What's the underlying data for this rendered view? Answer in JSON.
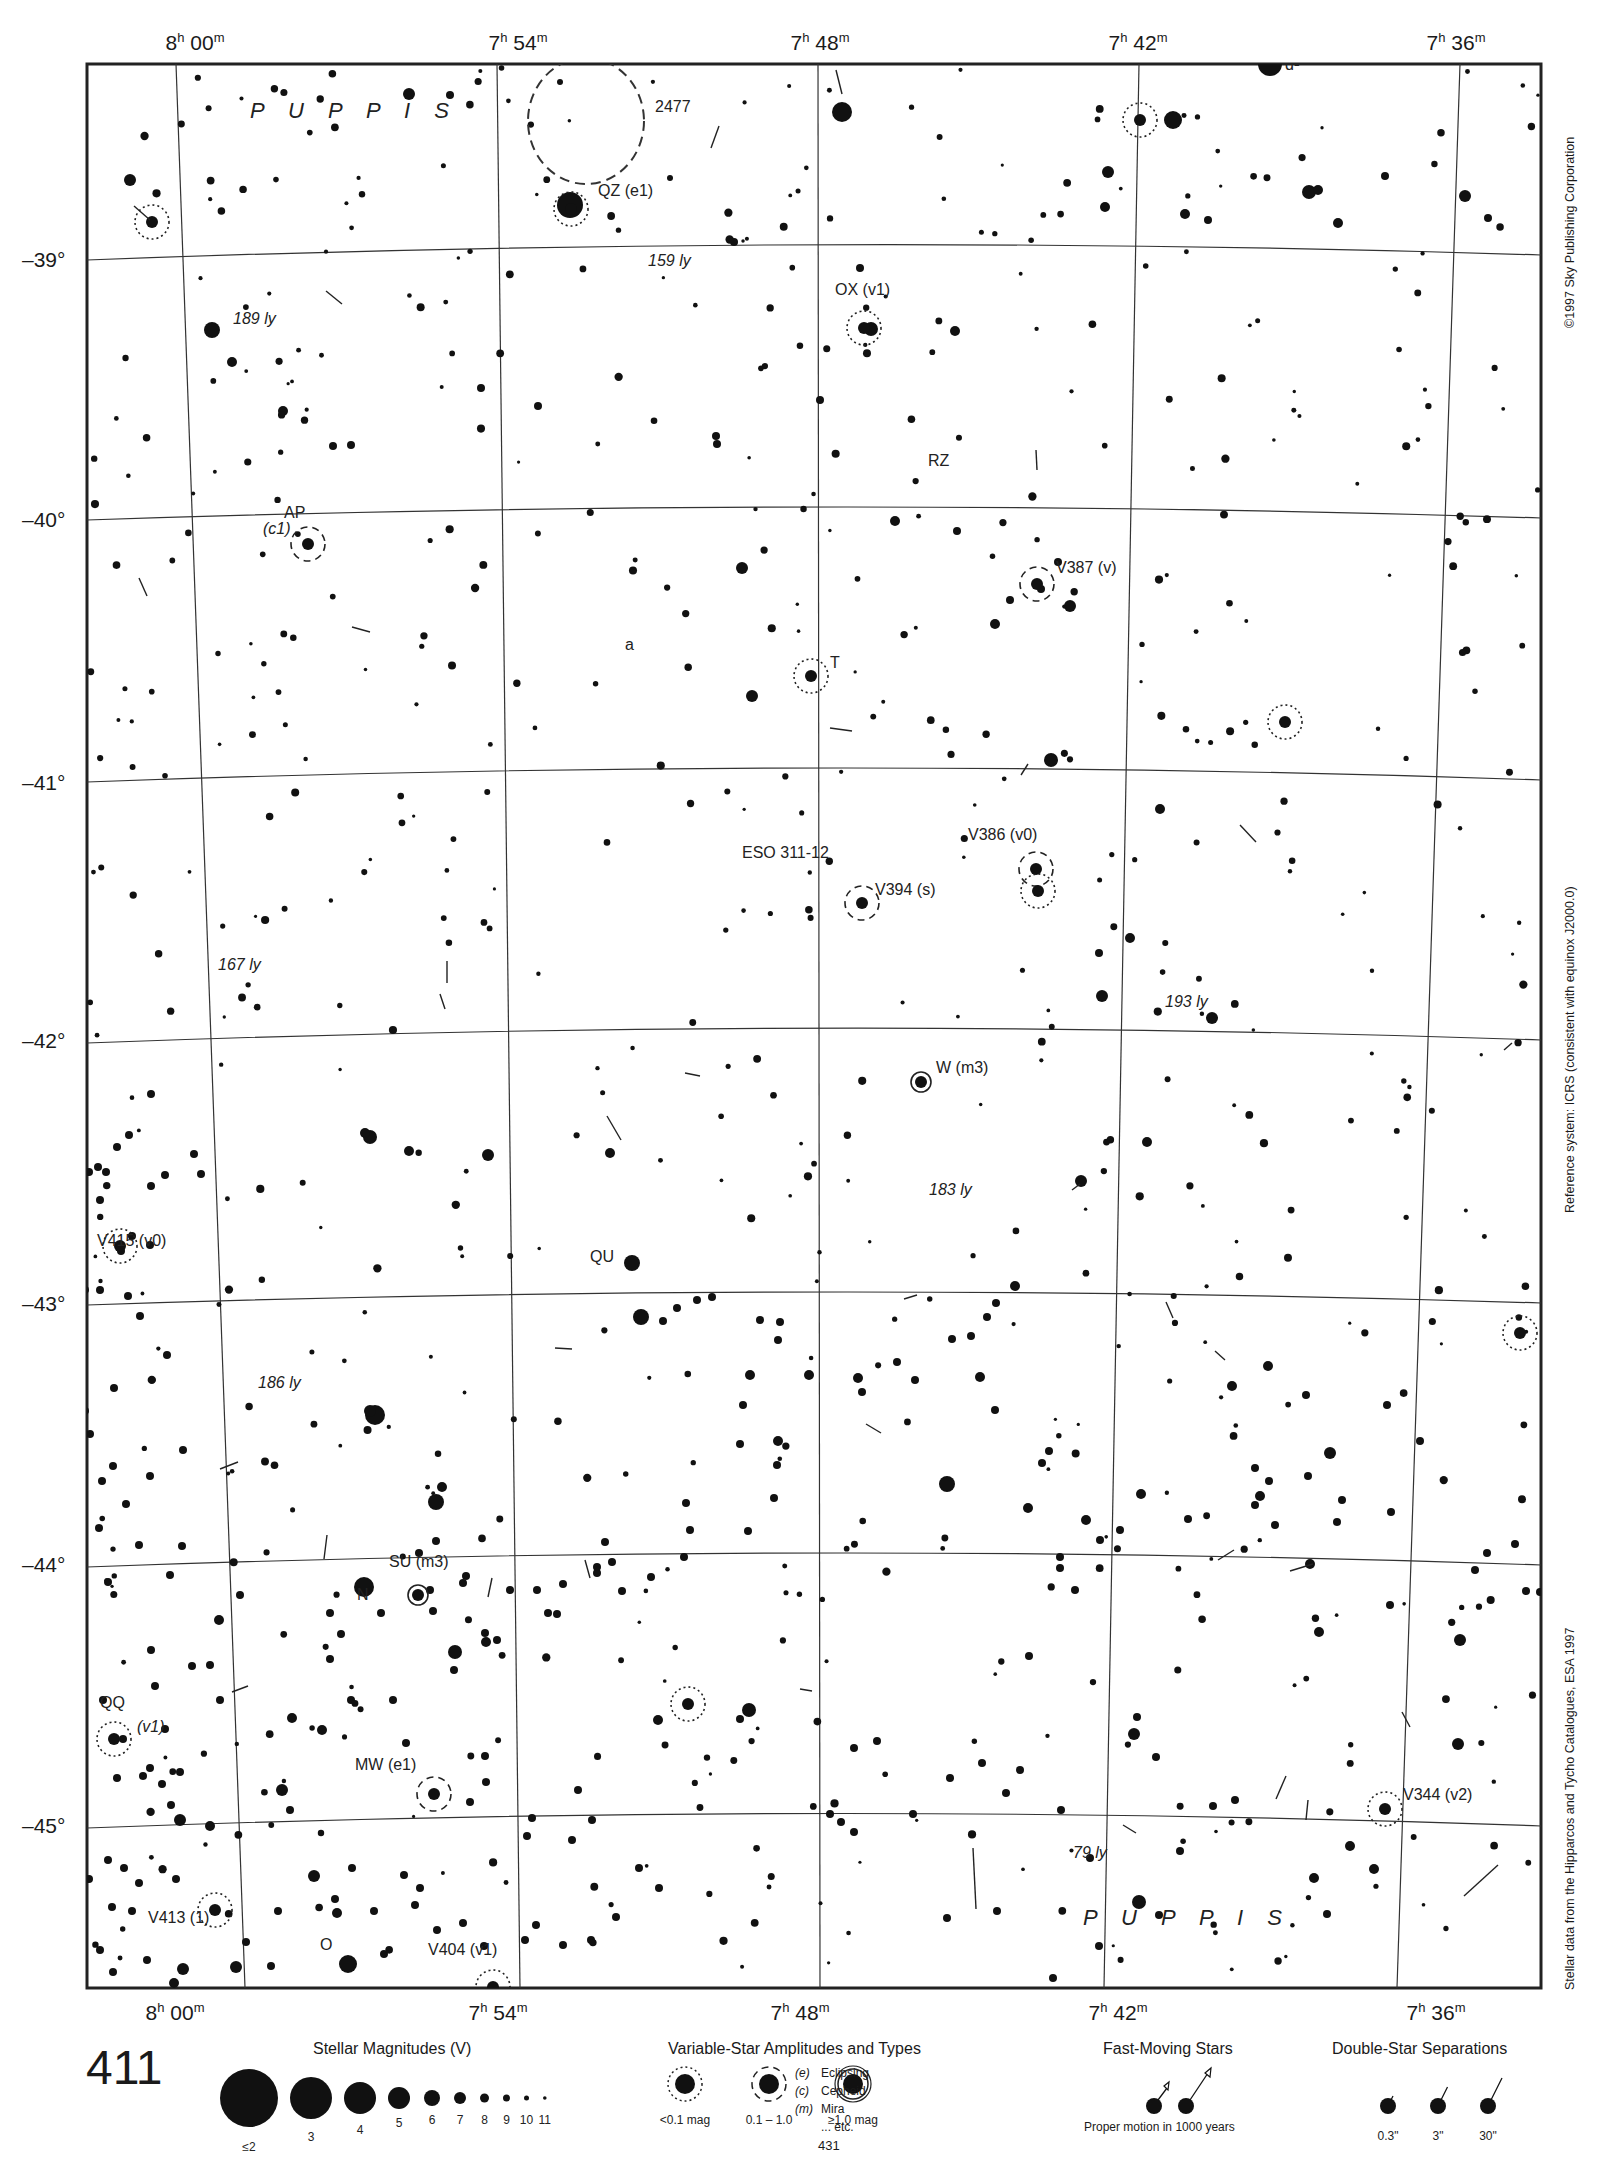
{
  "chart_title_page": "411",
  "adjacent_page_bottom": "431",
  "ra_labels": [
    {
      "h": "8",
      "m": "00",
      "x": 195
    },
    {
      "h": "7",
      "m": "54",
      "x": 518
    },
    {
      "h": "7",
      "m": "48",
      "x": 820
    },
    {
      "h": "7",
      "m": "42",
      "x": 1138
    },
    {
      "h": "7",
      "m": "36",
      "x": 1456
    }
  ],
  "dec_labels": [
    {
      "label": "–39°",
      "y": 262
    },
    {
      "label": "–40°",
      "y": 522
    },
    {
      "label": "–41°",
      "y": 785
    },
    {
      "label": "–42°",
      "y": 1043
    },
    {
      "label": "–43°",
      "y": 1306
    },
    {
      "label": "–44°",
      "y": 1567
    },
    {
      "label": "–45°",
      "y": 1828
    }
  ],
  "constellation_labels": [
    {
      "text": "P U P P I S",
      "x": 250,
      "y": 118
    },
    {
      "text": "P U P P I S",
      "x": 1083,
      "y": 1925
    }
  ],
  "objects": [
    {
      "text": "2477",
      "x": 655,
      "y": 112
    },
    {
      "text": "QZ (e1)",
      "x": 598,
      "y": 196
    },
    {
      "text": "159 ly",
      "x": 648,
      "y": 266,
      "italic": true
    },
    {
      "text": "OX (v1)",
      "x": 835,
      "y": 295
    },
    {
      "text": "189 ly",
      "x": 233,
      "y": 324,
      "italic": true
    },
    {
      "text": "d¹",
      "x": 1285,
      "y": 70
    },
    {
      "text": "RZ",
      "x": 928,
      "y": 466
    },
    {
      "text": "AP",
      "x": 284,
      "y": 518
    },
    {
      "text": "(c1)",
      "x": 263,
      "y": 534,
      "italic": true
    },
    {
      "text": "V387 (v)",
      "x": 1056,
      "y": 573
    },
    {
      "text": "a",
      "x": 625,
      "y": 650
    },
    {
      "text": "T",
      "x": 830,
      "y": 668
    },
    {
      "text": "ESO 311-12",
      "x": 742,
      "y": 858
    },
    {
      "text": "V386 (v0)",
      "x": 968,
      "y": 840
    },
    {
      "text": "V394 (s)",
      "x": 875,
      "y": 895
    },
    {
      "text": "167 ly",
      "x": 218,
      "y": 970,
      "italic": true
    },
    {
      "text": "193 ly",
      "x": 1165,
      "y": 1007,
      "italic": true
    },
    {
      "text": "W (m3)",
      "x": 936,
      "y": 1073
    },
    {
      "text": "183 ly",
      "x": 929,
      "y": 1195,
      "italic": true
    },
    {
      "text": "V415 (v0)",
      "x": 97,
      "y": 1246
    },
    {
      "text": "QU",
      "x": 590,
      "y": 1262
    },
    {
      "text": "186 ly",
      "x": 258,
      "y": 1388,
      "italic": true
    },
    {
      "text": "SU (m3)",
      "x": 389,
      "y": 1567
    },
    {
      "text": "N",
      "x": 357,
      "y": 1600
    },
    {
      "text": "QQ",
      "x": 100,
      "y": 1708
    },
    {
      "text": "(v1)",
      "x": 137,
      "y": 1732,
      "italic": true
    },
    {
      "text": "MW (e1)",
      "x": 355,
      "y": 1770
    },
    {
      "text": "V344 (v2)",
      "x": 1403,
      "y": 1800
    },
    {
      "text": "79 ly",
      "x": 1073,
      "y": 1858,
      "italic": true
    },
    {
      "text": "V413 (1)",
      "x": 148,
      "y": 1923
    },
    {
      "text": "O",
      "x": 320,
      "y": 1950
    },
    {
      "text": "V404 (v1)",
      "x": 428,
      "y": 1955
    }
  ],
  "side_notes": {
    "copyright": "©1997 Sky Publishing Corporation",
    "reference": "Reference system: ICRS (consistent with equinox J2000.0)",
    "source": "Stellar data from the Hipparcos and Tycho Catalogues, ESA 1997"
  },
  "legend": {
    "magnitudes": {
      "title": "Stellar Magnitudes (V)",
      "items": [
        {
          "label": "≤2",
          "r": 29
        },
        {
          "label": "3",
          "r": 21
        },
        {
          "label": "4",
          "r": 16
        },
        {
          "label": "5",
          "r": 11
        },
        {
          "label": "6",
          "r": 8
        },
        {
          "label": "7",
          "r": 6
        },
        {
          "label": "8",
          "r": 4.5
        },
        {
          "label": "9",
          "r": 3.5
        },
        {
          "label": "10",
          "r": 2.5
        },
        {
          "label": "11",
          "r": 1.8
        }
      ]
    },
    "variables": {
      "title": "Variable-Star Amplitudes and Types",
      "items": [
        {
          "label": "<0.1 mag",
          "style": "dotted"
        },
        {
          "label": "0.1 – 1.0",
          "style": "dashed"
        },
        {
          "label": "≥1.0 mag",
          "style": "solid"
        }
      ],
      "types": [
        {
          "code": "(e)",
          "name": "Eclipsing"
        },
        {
          "code": "(c)",
          "name": "Cepheid"
        },
        {
          "code": "(m)",
          "name": "Mira"
        },
        {
          "code": "",
          "name": "... etc."
        }
      ]
    },
    "fast_moving": {
      "title": "Fast-Moving Stars",
      "caption": "Proper motion in 1000 years"
    },
    "doubles": {
      "title": "Double-Star Separations",
      "items": [
        "0.3\"",
        "3\"",
        "30\""
      ]
    }
  },
  "stars": [
    [
      1270,
      64,
      12
    ],
    [
      842,
      112,
      10
    ],
    [
      1173,
      120,
      9
    ],
    [
      409,
      94,
      6
    ],
    [
      450,
      95,
      4
    ],
    [
      560,
      82,
      3
    ],
    [
      130,
      180,
      6
    ],
    [
      570,
      205,
      13
    ],
    [
      670,
      178,
      3
    ],
    [
      734,
      242,
      4
    ],
    [
      860,
      268,
      4
    ],
    [
      871,
      329,
      7
    ],
    [
      955,
      331,
      5
    ],
    [
      1108,
      172,
      6
    ],
    [
      1105,
      207,
      5
    ],
    [
      1185,
      214,
      5
    ],
    [
      1208,
      220,
      4
    ],
    [
      1309,
      192,
      7
    ],
    [
      1318,
      190,
      5
    ],
    [
      1338,
      223,
      5
    ],
    [
      1385,
      176,
      4
    ],
    [
      1465,
      196,
      6
    ],
    [
      1488,
      218,
      4
    ],
    [
      212,
      330,
      8
    ],
    [
      232,
      362,
      5
    ],
    [
      283,
      411,
      5
    ],
    [
      333,
      446,
      4
    ],
    [
      351,
      445,
      4
    ],
    [
      481,
      388,
      4
    ],
    [
      538,
      406,
      4
    ],
    [
      717,
      444,
      4
    ],
    [
      716,
      436,
      4
    ],
    [
      742,
      568,
      6
    ],
    [
      752,
      696,
      6
    ],
    [
      820,
      400,
      4
    ],
    [
      895,
      521,
      5
    ],
    [
      957,
      531,
      4
    ],
    [
      995,
      624,
      5
    ],
    [
      1010,
      600,
      4
    ],
    [
      1041,
      589,
      4
    ],
    [
      1058,
      562,
      4
    ],
    [
      1070,
      606,
      6
    ],
    [
      1051,
      760,
      7
    ],
    [
      1160,
      809,
      5
    ],
    [
      1130,
      938,
      5
    ],
    [
      1099,
      953,
      4
    ],
    [
      1102,
      996,
      6
    ],
    [
      1212,
      1018,
      6
    ],
    [
      1147,
      1142,
      5
    ],
    [
      1081,
      1181,
      6
    ],
    [
      1015,
      1286,
      5
    ],
    [
      996,
      1303,
      4
    ],
    [
      987,
      1317,
      4
    ],
    [
      1268,
      1366,
      5
    ],
    [
      1232,
      1386,
      5
    ],
    [
      1120,
      1530,
      4
    ],
    [
      1310,
      1564,
      5
    ],
    [
      1330,
      1453,
      6
    ],
    [
      1306,
      1395,
      4
    ],
    [
      947,
      1484,
      8
    ],
    [
      858,
      1378,
      5
    ],
    [
      862,
      1392,
      4
    ],
    [
      750,
      1375,
      5
    ],
    [
      778,
      1441,
      5
    ],
    [
      641,
      1317,
      8
    ],
    [
      632,
      1263,
      8
    ],
    [
      370,
      1137,
      7
    ],
    [
      365,
      1133,
      5
    ],
    [
      488,
      1155,
      6
    ],
    [
      409,
      1151,
      5
    ],
    [
      610,
      1153,
      5
    ],
    [
      375,
      1415,
      10
    ],
    [
      370,
      1411,
      6
    ],
    [
      436,
      1502,
      8
    ],
    [
      442,
      1487,
      5
    ],
    [
      364,
      1587,
      10
    ],
    [
      433,
      1611,
      4
    ],
    [
      322,
      1730,
      5
    ],
    [
      290,
      1810,
      4
    ],
    [
      180,
      1820,
      6
    ],
    [
      210,
      1826,
      5
    ],
    [
      183,
      1969,
      6
    ],
    [
      236,
      1967,
      6
    ],
    [
      174,
      1983,
      5
    ],
    [
      348,
      1964,
      9
    ],
    [
      219,
      1620,
      5
    ],
    [
      240,
      1595,
      4
    ],
    [
      292,
      1718,
      5
    ],
    [
      282,
      1790,
      6
    ],
    [
      314,
      1876,
      6
    ],
    [
      337,
      1913,
      5
    ],
    [
      455,
      1652,
      7
    ],
    [
      486,
      1642,
      5
    ],
    [
      658,
      1720,
      5
    ],
    [
      749,
      1710,
      7
    ],
    [
      740,
      1719,
      4
    ],
    [
      1134,
      1734,
      6
    ],
    [
      1137,
      1717,
      4
    ],
    [
      1319,
      1632,
      5
    ],
    [
      1390,
      1605,
      4
    ],
    [
      1460,
      1640,
      6
    ],
    [
      1458,
      1744,
      6
    ],
    [
      1374,
      1869,
      5
    ],
    [
      1327,
      1914,
      4
    ],
    [
      1314,
      1878,
      5
    ],
    [
      1350,
      1846,
      5
    ],
    [
      1156,
      1757,
      4
    ],
    [
      1061,
      1810,
      4
    ],
    [
      1090,
      1858,
      4
    ],
    [
      1139,
      1902,
      7
    ],
    [
      1180,
      1851,
      4
    ],
    [
      1235,
      1800,
      4
    ],
    [
      1213,
      1806,
      4
    ],
    [
      1159,
      1915,
      4
    ],
    [
      1099,
      1946,
      4
    ],
    [
      1053,
      1978,
      4
    ],
    [
      997,
      1911,
      4
    ],
    [
      947,
      1918,
      4
    ],
    [
      1006,
      1793,
      4
    ],
    [
      1020,
      1770,
      4
    ],
    [
      982,
      1763,
      4
    ],
    [
      877,
      1741,
      4
    ],
    [
      854,
      1748,
      4
    ],
    [
      854,
      1832,
      4
    ],
    [
      841,
      1822,
      4
    ],
    [
      830,
      1814,
      4
    ],
    [
      913,
      1814,
      4
    ],
    [
      950,
      1778,
      4
    ],
    [
      1029,
      1656,
      4
    ],
    [
      1188,
      1519,
      4
    ],
    [
      1260,
      1496,
      5
    ],
    [
      1255,
      1468,
      4
    ],
    [
      1269,
      1481,
      4
    ],
    [
      1308,
      1476,
      4
    ],
    [
      1387,
      1405,
      4
    ],
    [
      1420,
      1441,
      4
    ],
    [
      1487,
      1553,
      4
    ],
    [
      1515,
      1544,
      4
    ],
    [
      1526,
      1591,
      4
    ],
    [
      1540,
      1592,
      4
    ],
    [
      1475,
      1570,
      4
    ],
    [
      1391,
      1512,
      4
    ],
    [
      1342,
      1500,
      4
    ],
    [
      1337,
      1522,
      4
    ],
    [
      1275,
      1525,
      4
    ],
    [
      1255,
      1505,
      4
    ],
    [
      1141,
      1494,
      5
    ],
    [
      1086,
      1520,
      5
    ],
    [
      1100,
      1540,
      4
    ],
    [
      1075,
      1590,
      4
    ],
    [
      1060,
      1568,
      4
    ],
    [
      1060,
      1557,
      4
    ],
    [
      1028,
      1508,
      5
    ],
    [
      1049,
      1451,
      4
    ],
    [
      1042,
      1463,
      4
    ],
    [
      995,
      1410,
      4
    ],
    [
      980,
      1377,
      5
    ],
    [
      915,
      1380,
      4
    ],
    [
      952,
      1339,
      4
    ],
    [
      971,
      1336,
      4
    ],
    [
      897,
      1362,
      4
    ],
    [
      809,
      1375,
      5
    ],
    [
      778,
      1340,
      4
    ],
    [
      760,
      1320,
      4
    ],
    [
      780,
      1322,
      4
    ],
    [
      712,
      1297,
      4
    ],
    [
      697,
      1300,
      4
    ],
    [
      677,
      1308,
      4
    ],
    [
      663,
      1321,
      4
    ],
    [
      743,
      1405,
      4
    ],
    [
      740,
      1444,
      4
    ],
    [
      777,
      1465,
      4
    ],
    [
      774,
      1498,
      4
    ],
    [
      748,
      1531,
      4
    ],
    [
      686,
      1503,
      4
    ],
    [
      690,
      1530,
      4
    ],
    [
      684,
      1557,
      4
    ],
    [
      605,
      1542,
      4
    ],
    [
      597,
      1573,
      4
    ],
    [
      597,
      1567,
      4
    ],
    [
      622,
      1591,
      4
    ],
    [
      612,
      1562,
      4
    ],
    [
      651,
      1577,
      4
    ],
    [
      563,
      1584,
      4
    ],
    [
      537,
      1590,
      4
    ],
    [
      510,
      1590,
      4
    ],
    [
      463,
      1583,
      4
    ],
    [
      557,
      1614,
      4
    ],
    [
      548,
      1613,
      4
    ],
    [
      497,
      1640,
      4
    ],
    [
      485,
      1633,
      4
    ],
    [
      430,
      1590,
      4
    ],
    [
      466,
      1576,
      4
    ],
    [
      436,
      1541,
      4
    ],
    [
      419,
      1553,
      4
    ],
    [
      330,
      1613,
      4
    ],
    [
      341,
      1634,
      4
    ],
    [
      381,
      1613,
      4
    ],
    [
      454,
      1670,
      4
    ],
    [
      330,
      1659,
      4
    ],
    [
      351,
      1700,
      4
    ],
    [
      393,
      1700,
      4
    ],
    [
      406,
      1743,
      4
    ],
    [
      485,
      1756,
      4
    ],
    [
      486,
      1782,
      4
    ],
    [
      470,
      1802,
      4
    ],
    [
      532,
      1818,
      4
    ],
    [
      527,
      1836,
      4
    ],
    [
      578,
      1790,
      4
    ],
    [
      592,
      1820,
      4
    ],
    [
      572,
      1840,
      4
    ],
    [
      639,
      1868,
      4
    ],
    [
      659,
      1888,
      4
    ],
    [
      616,
      1917,
      4
    ],
    [
      591,
      1940,
      4
    ],
    [
      563,
      1945,
      4
    ],
    [
      536,
      1925,
      4
    ],
    [
      525,
      1940,
      4
    ],
    [
      484,
      1946,
      4
    ],
    [
      463,
      1923,
      4
    ],
    [
      437,
      1930,
      4
    ],
    [
      404,
      1875,
      4
    ],
    [
      415,
      1905,
      4
    ],
    [
      420,
      1888,
      4
    ],
    [
      384,
      1954,
      4
    ],
    [
      352,
      1868,
      4
    ],
    [
      335,
      1899,
      4
    ],
    [
      374,
      1911,
      4
    ],
    [
      278,
      1911,
      4
    ],
    [
      271,
      1966,
      4
    ],
    [
      246,
      1942,
      4
    ],
    [
      124,
      1868,
      4
    ],
    [
      108,
      1860,
      4
    ],
    [
      112,
      1907,
      4
    ],
    [
      100,
      1950,
      4
    ],
    [
      113,
      1972,
      4
    ],
    [
      72,
      1964,
      4
    ],
    [
      89,
      1879,
      4
    ],
    [
      139,
      1883,
      4
    ],
    [
      132,
      1911,
      4
    ],
    [
      176,
      1879,
      4
    ],
    [
      147,
      1960,
      4
    ],
    [
      103,
      1700,
      4
    ],
    [
      123,
      1739,
      4
    ],
    [
      117,
      1778,
      4
    ],
    [
      162,
      1784,
      4
    ],
    [
      171,
      1805,
      4
    ],
    [
      150,
      1768,
      4
    ],
    [
      143,
      1776,
      4
    ],
    [
      220,
      1700,
      4
    ],
    [
      210,
      1665,
      4
    ],
    [
      192,
      1666,
      4
    ],
    [
      180,
      1772,
      4
    ],
    [
      155,
      1686,
      4
    ],
    [
      165,
      1729,
      4
    ],
    [
      151,
      1650,
      4
    ],
    [
      170,
      1575,
      4
    ],
    [
      108,
      1582,
      4
    ],
    [
      99,
      1528,
      4
    ],
    [
      139,
      1545,
      4
    ],
    [
      126,
      1504,
      4
    ],
    [
      182,
      1546,
      4
    ],
    [
      150,
      1476,
      4
    ],
    [
      183,
      1450,
      4
    ],
    [
      113,
      1466,
      4
    ],
    [
      102,
      1481,
      4
    ],
    [
      83,
      1458,
      4
    ],
    [
      114,
      1388,
      4
    ],
    [
      90,
      1434,
      4
    ],
    [
      85,
      1411,
      4
    ],
    [
      167,
      1355,
      4
    ],
    [
      140,
      1316,
      4
    ],
    [
      128,
      1296,
      4
    ],
    [
      85,
      1290,
      4
    ],
    [
      100,
      1290,
      4
    ],
    [
      121,
      1251,
      4
    ],
    [
      132,
      1236,
      4
    ],
    [
      150,
      1245,
      4
    ],
    [
      100,
      1200,
      4
    ],
    [
      106,
      1172,
      4
    ],
    [
      98,
      1167,
      4
    ],
    [
      165,
      1175,
      4
    ],
    [
      194,
      1154,
      4
    ],
    [
      201,
      1174,
      4
    ],
    [
      151,
      1186,
      4
    ],
    [
      117,
      1147,
      4
    ],
    [
      129,
      1135,
      4
    ],
    [
      151,
      1094,
      4
    ],
    [
      89,
      1172,
      4
    ]
  ],
  "variable_stars": [
    [
      571,
      209,
      "dotted"
    ],
    [
      152,
      222,
      "dotted"
    ],
    [
      864,
      328,
      "dotted"
    ],
    [
      1140,
      120,
      "dotted"
    ],
    [
      308,
      544,
      "dashed"
    ],
    [
      1037,
      584,
      "dashed"
    ],
    [
      811,
      676,
      "dotted"
    ],
    [
      1285,
      722,
      "dotted"
    ],
    [
      1036,
      869,
      "dashed"
    ],
    [
      1038,
      891,
      "dotted"
    ],
    [
      862,
      903,
      "dashed"
    ],
    [
      921,
      1082,
      "solid"
    ],
    [
      120,
      1246,
      "dotted"
    ],
    [
      1520,
      1333,
      "dotted"
    ],
    [
      418,
      1595,
      "solid"
    ],
    [
      688,
      1704,
      "dotted"
    ],
    [
      114,
      1739,
      "dotted"
    ],
    [
      434,
      1794,
      "dashed"
    ],
    [
      1385,
      1809,
      "dotted"
    ],
    [
      215,
      1910,
      "dotted"
    ],
    [
      493,
      1987,
      "dotted"
    ]
  ],
  "open_cluster": {
    "x": 586,
    "y": 121,
    "rx": 58,
    "ry": 63
  }
}
